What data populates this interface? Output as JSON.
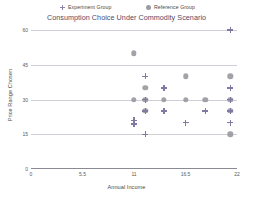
{
  "chart_data": {
    "type": "scatter",
    "title": "Consumption Choice Under Commodity Scenario",
    "xlabel": "Annual Income",
    "ylabel": "Price Range Chosen",
    "xlim": [
      0,
      22
    ],
    "ylim": [
      0,
      60
    ],
    "xticks": [
      "0",
      "5.5",
      "11",
      "16.5",
      "22"
    ],
    "xtick_values": [
      0,
      5.5,
      11,
      16.5,
      22
    ],
    "yticks": [
      "60",
      "45",
      "30",
      "15",
      "0"
    ],
    "ytick_values": [
      60,
      45,
      30,
      15,
      0
    ],
    "grid": true,
    "grid_axis": "y",
    "legend_position": "top",
    "series": [
      {
        "name": "Experiment Group",
        "marker": "plus",
        "color": "#8179a3",
        "points": [
          {
            "x": 21.3,
            "y": 60
          },
          {
            "x": 12.2,
            "y": 40
          },
          {
            "x": 14.2,
            "y": 35
          },
          {
            "x": 21.3,
            "y": 35
          },
          {
            "x": 12.2,
            "y": 30
          },
          {
            "x": 21.3,
            "y": 30
          },
          {
            "x": 12.2,
            "y": 25
          },
          {
            "x": 14.2,
            "y": 25
          },
          {
            "x": 18.6,
            "y": 25
          },
          {
            "x": 21.3,
            "y": 25
          },
          {
            "x": 11.0,
            "y": 21
          },
          {
            "x": 11.0,
            "y": 19.5
          },
          {
            "x": 16.5,
            "y": 20
          },
          {
            "x": 21.3,
            "y": 20
          },
          {
            "x": 12.2,
            "y": 15
          }
        ]
      },
      {
        "name": "Reference Group",
        "marker": "circle",
        "color": "#9a9aa2",
        "points": [
          {
            "x": 11.0,
            "y": 50
          },
          {
            "x": 16.5,
            "y": 40
          },
          {
            "x": 21.3,
            "y": 40
          },
          {
            "x": 12.2,
            "y": 35
          },
          {
            "x": 11.0,
            "y": 30
          },
          {
            "x": 12.2,
            "y": 30
          },
          {
            "x": 14.2,
            "y": 30
          },
          {
            "x": 16.5,
            "y": 30
          },
          {
            "x": 18.6,
            "y": 30
          },
          {
            "x": 21.3,
            "y": 30
          },
          {
            "x": 12.2,
            "y": 25
          },
          {
            "x": 21.3,
            "y": 25
          },
          {
            "x": 21.3,
            "y": 15
          }
        ]
      }
    ]
  },
  "legend": {
    "items": [
      {
        "label": "Experiment Group"
      },
      {
        "label": "Reference Group"
      }
    ]
  }
}
